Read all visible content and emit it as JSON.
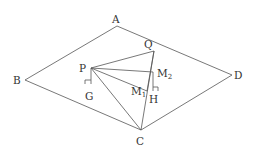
{
  "diagram": {
    "type": "geometry",
    "points": {
      "A": {
        "label": "A",
        "x": 117,
        "y": 26
      },
      "B": {
        "label": "B",
        "x": 25,
        "y": 80
      },
      "C": {
        "label": "C",
        "x": 141,
        "y": 130
      },
      "D": {
        "label": "D",
        "x": 232,
        "y": 75
      },
      "P": {
        "label": "P",
        "x": 91,
        "y": 68
      },
      "Q": {
        "label": "Q",
        "x": 154,
        "y": 51
      },
      "M2": {
        "label": "M",
        "sub": "2",
        "x": 153,
        "y": 72
      },
      "M1": {
        "label": "M",
        "sub": "1",
        "x": 147,
        "y": 91
      },
      "G": {
        "label": "G",
        "x": 91,
        "y": 84
      },
      "H": {
        "label": "H",
        "x": 153,
        "y": 91
      }
    },
    "segments": [
      [
        "A",
        "B"
      ],
      [
        "B",
        "C"
      ],
      [
        "C",
        "D"
      ],
      [
        "D",
        "A"
      ],
      [
        "P",
        "Q"
      ],
      [
        "P",
        "M2"
      ],
      [
        "P",
        "M1"
      ],
      [
        "P",
        "C"
      ],
      [
        "Q",
        "C"
      ],
      [
        "Q",
        "M2"
      ],
      [
        "M2",
        "M1"
      ],
      [
        "M1",
        "C"
      ],
      [
        "P",
        "G"
      ],
      [
        "M2",
        "H"
      ]
    ],
    "right_angles": [
      "G",
      "H"
    ],
    "line_color": "#555555"
  }
}
